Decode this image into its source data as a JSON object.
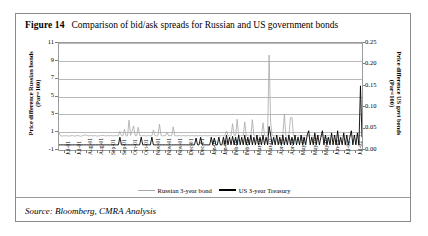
{
  "figure": {
    "label": "Figure 14",
    "title": "Comparison of bid/ask spreads for Russian and US government bonds",
    "source": "Source: Bloomberg, CMRA Analysis"
  },
  "colors": {
    "russian_line": "#a8a8a8",
    "us_line": "#000000",
    "grid": "#b9b9b9",
    "frame": "#9b9b9b",
    "card_border": "#8a8a8a",
    "background": "#ffffff"
  },
  "chart_data": {
    "type": "line",
    "title": "Comparison of bid/ask spreads for Russian and US government bonds",
    "xlabel": "",
    "ylabel": "Price difference Russian bonds (Par=100)",
    "y2label": "Price difference US govt bonds (Par=100)",
    "ylim": [
      -1,
      11
    ],
    "yticks": [
      11,
      9,
      7,
      5,
      3,
      1,
      -1
    ],
    "y2lim": [
      0.0,
      0.25
    ],
    "y2ticks": [
      "0.25",
      "0.20",
      "0.15",
      "0.10",
      "0.05",
      "0.00"
    ],
    "grid": true,
    "legend_position": "bottom",
    "xticklabels": [
      "Jul-01",
      "Jul-01",
      "Aug-01",
      "Aug-01",
      "Sep-01",
      "Sep-01",
      "Oct-01",
      "Oct-01",
      "Nov-01",
      "Nov-01",
      "Nov-01",
      "Dec-01",
      "Dec-01",
      "Jan-02",
      "Jan-02",
      "Feb-02",
      "Feb-02",
      "Mar-02",
      "Mar-02",
      "Apr-02",
      "Apr-02",
      "May-02",
      "May-02",
      "May-02",
      "Jun-02",
      "Jul-02",
      "Jul-02"
    ],
    "series": [
      {
        "name": "Russian 3-year bond",
        "axis": "left",
        "color": "#a8a8a8",
        "values": [
          0.95,
          0.6,
          0.55,
          0.6,
          0.58,
          0.62,
          0.55,
          0.58,
          0.6,
          0.62,
          0.55,
          0.58,
          0.62,
          0.6,
          0.55,
          0.58,
          0.62,
          0.7,
          0.65,
          0.6,
          0.58,
          0.62,
          0.6,
          0.58,
          0.62,
          0.55,
          0.58,
          0.6,
          0.62,
          0.65,
          0.6,
          0.58,
          0.62,
          0.58,
          0.62,
          0.6,
          0.58,
          0.62,
          0.6,
          0.58,
          1.1,
          0.62,
          0.58,
          1.35,
          0.6,
          0.58,
          2.35,
          0.62,
          1.15,
          1.7,
          0.62,
          0.6,
          1.55,
          0.62,
          0.58,
          0.6,
          0.62,
          0.58,
          0.6,
          0.62,
          0.58,
          0.6,
          1.25,
          0.62,
          0.58,
          0.6,
          1.9,
          0.62,
          0.58,
          0.6,
          0.62,
          1.0,
          0.58,
          0.62,
          0.6,
          1.6,
          0.62,
          0.58,
          0.6,
          0.62,
          0.58,
          0.6,
          0.62,
          0.58,
          0.6,
          0.62,
          0.58,
          0.62,
          0.6,
          0.58,
          0.62,
          0.58,
          0.6,
          0.62,
          0.58,
          0.6,
          0.62,
          0.58,
          0.6,
          0.62,
          0.58,
          0.62,
          0.6,
          0.58,
          0.62,
          0.6,
          0.58,
          0.62,
          0.58,
          0.6,
          1.15,
          0.62,
          0.58,
          0.6,
          1.95,
          0.62,
          0.58,
          2.45,
          0.6,
          0.58,
          0.62,
          0.58,
          2.15,
          0.6,
          0.62,
          0.58,
          0.6,
          2.4,
          0.62,
          0.58,
          0.6,
          0.62,
          0.58,
          0.6,
          2.05,
          0.62,
          0.58,
          0.6,
          9.65,
          2.1,
          0.62,
          0.58,
          0.6,
          0.62,
          0.58,
          0.6,
          0.62,
          0.58,
          3.05,
          0.6,
          0.58,
          0.62,
          2.6,
          2.65,
          0.6,
          0.58,
          0.62,
          0.58,
          0.6,
          0.62,
          0.58,
          0.6,
          0.62,
          0.58,
          0.6,
          0.62,
          0.58,
          0.6,
          0.62,
          0.58,
          0.6,
          0.62,
          0.58,
          0.6,
          0.62,
          0.58,
          0.6,
          0.62,
          0.58,
          0.6,
          0.62,
          0.58,
          0.6,
          0.62,
          0.58,
          0.6,
          0.62,
          0.58,
          0.6,
          0.62,
          0.58,
          0.6,
          0.62,
          0.58,
          0.6,
          0.62,
          0.58,
          0.6,
          0.62,
          0.58
        ]
      },
      {
        "name": "US 3-year Treasury",
        "axis": "right",
        "color": "#000000",
        "values": [
          0.012,
          0.012,
          0.012,
          0.012,
          0.012,
          0.012,
          0.012,
          0.012,
          0.012,
          0.012,
          0.012,
          0.012,
          0.012,
          0.012,
          0.012,
          0.012,
          0.012,
          0.012,
          0.012,
          0.012,
          0.012,
          0.012,
          0.012,
          0.012,
          0.012,
          0.012,
          0.012,
          0.012,
          0.012,
          0.012,
          0.012,
          0.012,
          0.012,
          0.012,
          0.012,
          0.012,
          0.012,
          0.012,
          0.012,
          0.012,
          0.03,
          0.012,
          0.012,
          0.012,
          0.012,
          0.012,
          0.012,
          0.012,
          0.012,
          0.012,
          0.012,
          0.012,
          0.012,
          0.012,
          0.03,
          0.012,
          0.012,
          0.012,
          0.012,
          0.012,
          0.012,
          0.03,
          0.012,
          0.012,
          0.012,
          0.012,
          0.012,
          0.012,
          0.012,
          0.012,
          0.012,
          0.012,
          0.012,
          0.012,
          0.012,
          0.012,
          0.012,
          0.012,
          0.012,
          0.012,
          0.012,
          0.012,
          0.012,
          0.012,
          0.012,
          0.012,
          0.012,
          0.012,
          0.012,
          0.012,
          0.028,
          0.012,
          0.012,
          0.03,
          0.012,
          0.012,
          0.012,
          0.012,
          0.012,
          0.012,
          0.03,
          0.012,
          0.028,
          0.012,
          0.012,
          0.03,
          0.012,
          0.012,
          0.03,
          0.012,
          0.035,
          0.012,
          0.03,
          0.012,
          0.032,
          0.012,
          0.03,
          0.012,
          0.035,
          0.012,
          0.03,
          0.012,
          0.035,
          0.012,
          0.03,
          0.012,
          0.035,
          0.012,
          0.03,
          0.012,
          0.035,
          0.012,
          0.03,
          0.012,
          0.035,
          0.012,
          0.03,
          0.012,
          0.055,
          0.035,
          0.012,
          0.03,
          0.012,
          0.035,
          0.012,
          0.03,
          0.012,
          0.035,
          0.012,
          0.03,
          0.012,
          0.035,
          0.012,
          0.03,
          0.012,
          0.035,
          0.012,
          0.03,
          0.012,
          0.035,
          0.012,
          0.03,
          0.012,
          0.035,
          0.045,
          0.012,
          0.03,
          0.012,
          0.04,
          0.012,
          0.035,
          0.012,
          0.03,
          0.045,
          0.012,
          0.035,
          0.012,
          0.03,
          0.012,
          0.04,
          0.012,
          0.035,
          0.012,
          0.045,
          0.012,
          0.03,
          0.012,
          0.04,
          0.012,
          0.035,
          0.012,
          0.03,
          0.045,
          0.012,
          0.035,
          0.012,
          0.04,
          0.012,
          0.15,
          0.03
        ]
      }
    ]
  }
}
